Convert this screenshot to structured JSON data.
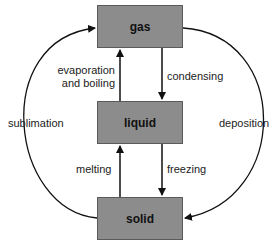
{
  "diagram": {
    "type": "phase-transition-cycle",
    "colors": {
      "box_fill": "#8c8c8c",
      "box_border": "#5a5a5a",
      "arrow": "#111111",
      "text": "#222222"
    },
    "states": {
      "gas": "gas",
      "liquid": "liquid",
      "solid": "solid"
    },
    "transitions": {
      "evaporation": "evaporation",
      "evaporation_line2": "and boiling",
      "condensing": "condensing",
      "sublimation": "sublimation",
      "deposition": "deposition",
      "melting": "melting",
      "freezing": "freezing"
    },
    "edges": [
      {
        "from": "liquid",
        "to": "gas",
        "label": "evaporation and boiling"
      },
      {
        "from": "gas",
        "to": "liquid",
        "label": "condensing"
      },
      {
        "from": "solid",
        "to": "liquid",
        "label": "melting"
      },
      {
        "from": "liquid",
        "to": "solid",
        "label": "freezing"
      },
      {
        "from": "solid",
        "to": "gas",
        "label": "sublimation"
      },
      {
        "from": "gas",
        "to": "solid",
        "label": "deposition"
      }
    ]
  }
}
